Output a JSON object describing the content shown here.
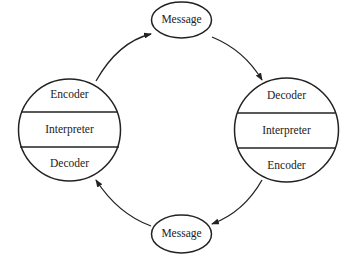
{
  "diagram": {
    "type": "communication-cycle",
    "nodes": {
      "left_circle": {
        "sections": [
          "Encoder",
          "Interpreter",
          "Decoder"
        ]
      },
      "right_circle": {
        "sections": [
          "Decoder",
          "Interpreter",
          "Encoder"
        ]
      },
      "top_message": {
        "label": "Message"
      },
      "bottom_message": {
        "label": "Message"
      }
    },
    "edges": [
      {
        "from": "left_circle",
        "to": "top_message"
      },
      {
        "from": "top_message",
        "to": "right_circle"
      },
      {
        "from": "right_circle",
        "to": "bottom_message"
      },
      {
        "from": "bottom_message",
        "to": "left_circle"
      }
    ],
    "colors": {
      "line": "#222222",
      "background": "#ffffff"
    }
  }
}
